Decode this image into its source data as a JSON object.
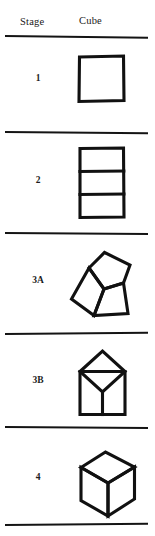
{
  "figure": {
    "columns": [
      {
        "key": "stage",
        "label": "Stage"
      },
      {
        "key": "cube",
        "label": "Cube"
      }
    ],
    "ink_color": "#111111",
    "background_color": "#ffffff",
    "rule_color": "#141414",
    "rows": [
      {
        "stage": "1",
        "shape_name": "square",
        "shape_description": "A single plain square outline."
      },
      {
        "stage": "2",
        "shape_name": "rectangle-divided-in-three",
        "shape_description": "An upright rectangle divided by two horizontal lines into three stacked bands."
      },
      {
        "stage": "3A",
        "shape_name": "tapered-prism-with-top-face",
        "shape_description": "A tapered trapezoidal block tilted left, showing a slanted top face and two side faces."
      },
      {
        "stage": "3B",
        "shape_name": "square-with-diamond-top",
        "shape_description": "An upright square body topped by a diamond, with a Y junction meeting the body."
      },
      {
        "stage": "4",
        "shape_name": "isometric-cube",
        "shape_description": "A correctly drawn isometric cube with top face and two visible side faces."
      }
    ],
    "rules": [
      {
        "name": "rule-under-header",
        "y": 35
      },
      {
        "name": "rule-after-stage-1",
        "y": 132
      },
      {
        "name": "rule-after-stage-2",
        "y": 233
      },
      {
        "name": "rule-after-stage-3a",
        "y": 334
      },
      {
        "name": "rule-after-stage-3b",
        "y": 427
      },
      {
        "name": "rule-bottom",
        "y": 525
      }
    ]
  }
}
